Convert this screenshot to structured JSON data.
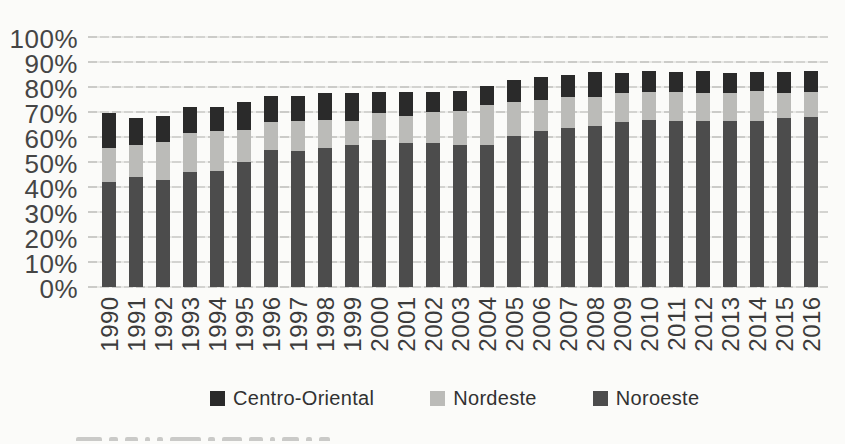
{
  "chart_data": {
    "type": "bar",
    "stacked": true,
    "title": "",
    "xlabel": "",
    "ylabel": "",
    "ylim": [
      0,
      100
    ],
    "ytick_step": 10,
    "grid": true,
    "legend_position": "bottom",
    "ytick_labels": [
      "100%",
      "90%",
      "80%",
      "70%",
      "60%",
      "50%",
      "40%",
      "30%",
      "20%",
      "10%",
      "0%"
    ],
    "categories": [
      "1990",
      "1991",
      "1992",
      "1993",
      "1994",
      "1995",
      "1996",
      "1997",
      "1998",
      "1999",
      "2000",
      "2001",
      "2002",
      "2003",
      "2004",
      "2005",
      "2006",
      "2007",
      "2008",
      "2009",
      "2010",
      "2011",
      "2012",
      "2013",
      "2014",
      "2015",
      "2016"
    ],
    "series": [
      {
        "name": "Noroeste",
        "color": "#4c4c4c",
        "values": [
          42,
          44,
          43,
          46,
          46.5,
          50,
          55,
          54.5,
          55.5,
          57,
          59,
          57.5,
          57.5,
          57,
          57,
          60.5,
          62.5,
          63.5,
          64.5,
          66,
          67,
          66.5,
          66.5,
          66.5,
          66.5,
          67.5,
          68
        ]
      },
      {
        "name": "Nordeste",
        "color": "#bbbbb8",
        "values": [
          13.5,
          13,
          15,
          15.5,
          16,
          13,
          11,
          12,
          11.5,
          9.5,
          10.5,
          11,
          12.5,
          13.5,
          16,
          13.5,
          12.5,
          12.5,
          11.5,
          11.5,
          11,
          11.5,
          11,
          11,
          12,
          10,
          10
        ]
      },
      {
        "name": "Centro-Oriental",
        "color": "#2a2a2a",
        "values": [
          14,
          10.5,
          10.5,
          10.5,
          9.5,
          11,
          10.5,
          10,
          10.5,
          11,
          8.5,
          9.5,
          8,
          8,
          7.5,
          9,
          9,
          9,
          10,
          8,
          8.5,
          8,
          9,
          8,
          7.5,
          8.5,
          8.5
        ]
      }
    ],
    "stack_totals": [
      69.5,
      67.5,
      68.5,
      72,
      72,
      74,
      76.5,
      76.5,
      77.5,
      77.5,
      78,
      78,
      78,
      78.5,
      80.5,
      83,
      84,
      85,
      86,
      85.5,
      86.5,
      86,
      86.5,
      85.5,
      86,
      86,
      86.5
    ],
    "legend_items": [
      {
        "label": "Centro-Oriental",
        "color": "#2a2a2a"
      },
      {
        "label": "Nordeste",
        "color": "#bbbbb8"
      },
      {
        "label": "Noroeste",
        "color": "#4c4c4c"
      }
    ]
  },
  "footer": {
    "cutoff_caption_marks": [
      26,
      9,
      13,
      5,
      6,
      31,
      7,
      20,
      14,
      5,
      17,
      6,
      11
    ]
  },
  "colors": {
    "background": "#fbfbf9",
    "gridline": "#c6c6c3",
    "axis_text": "#454545"
  }
}
